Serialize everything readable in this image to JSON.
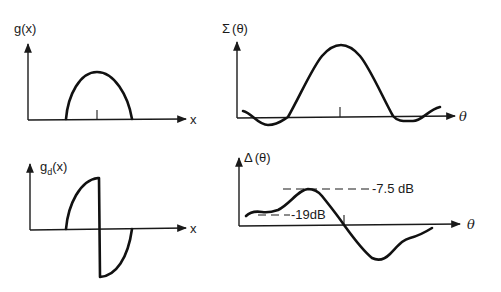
{
  "figure": {
    "panels": [
      {
        "id": "aperture-sum",
        "ylabel": "g(x)",
        "xlabel": "x",
        "description": "Symmetric half-cosine aperture distribution"
      },
      {
        "id": "pattern-sum",
        "ylabel_symbol": "Σ",
        "ylabel_arg": "(θ)",
        "xlabel": "θ",
        "description": "Sum pattern with main lobe and sidelobes"
      },
      {
        "id": "aperture-difference",
        "ylabel_main": "g",
        "ylabel_sub": "d",
        "ylabel_arg": "(x)",
        "xlabel": "x",
        "description": "Antisymmetric difference aperture distribution"
      },
      {
        "id": "pattern-difference",
        "ylabel_symbol": "Δ",
        "ylabel_arg": "(θ)",
        "xlabel": "θ",
        "annotations": {
          "peak_level": "-7.5 dB",
          "sidelobe_level": "-19dB"
        },
        "description": "Difference pattern with null at boresight"
      }
    ]
  },
  "colors": {
    "ink": "#111111",
    "background": "#ffffff"
  }
}
